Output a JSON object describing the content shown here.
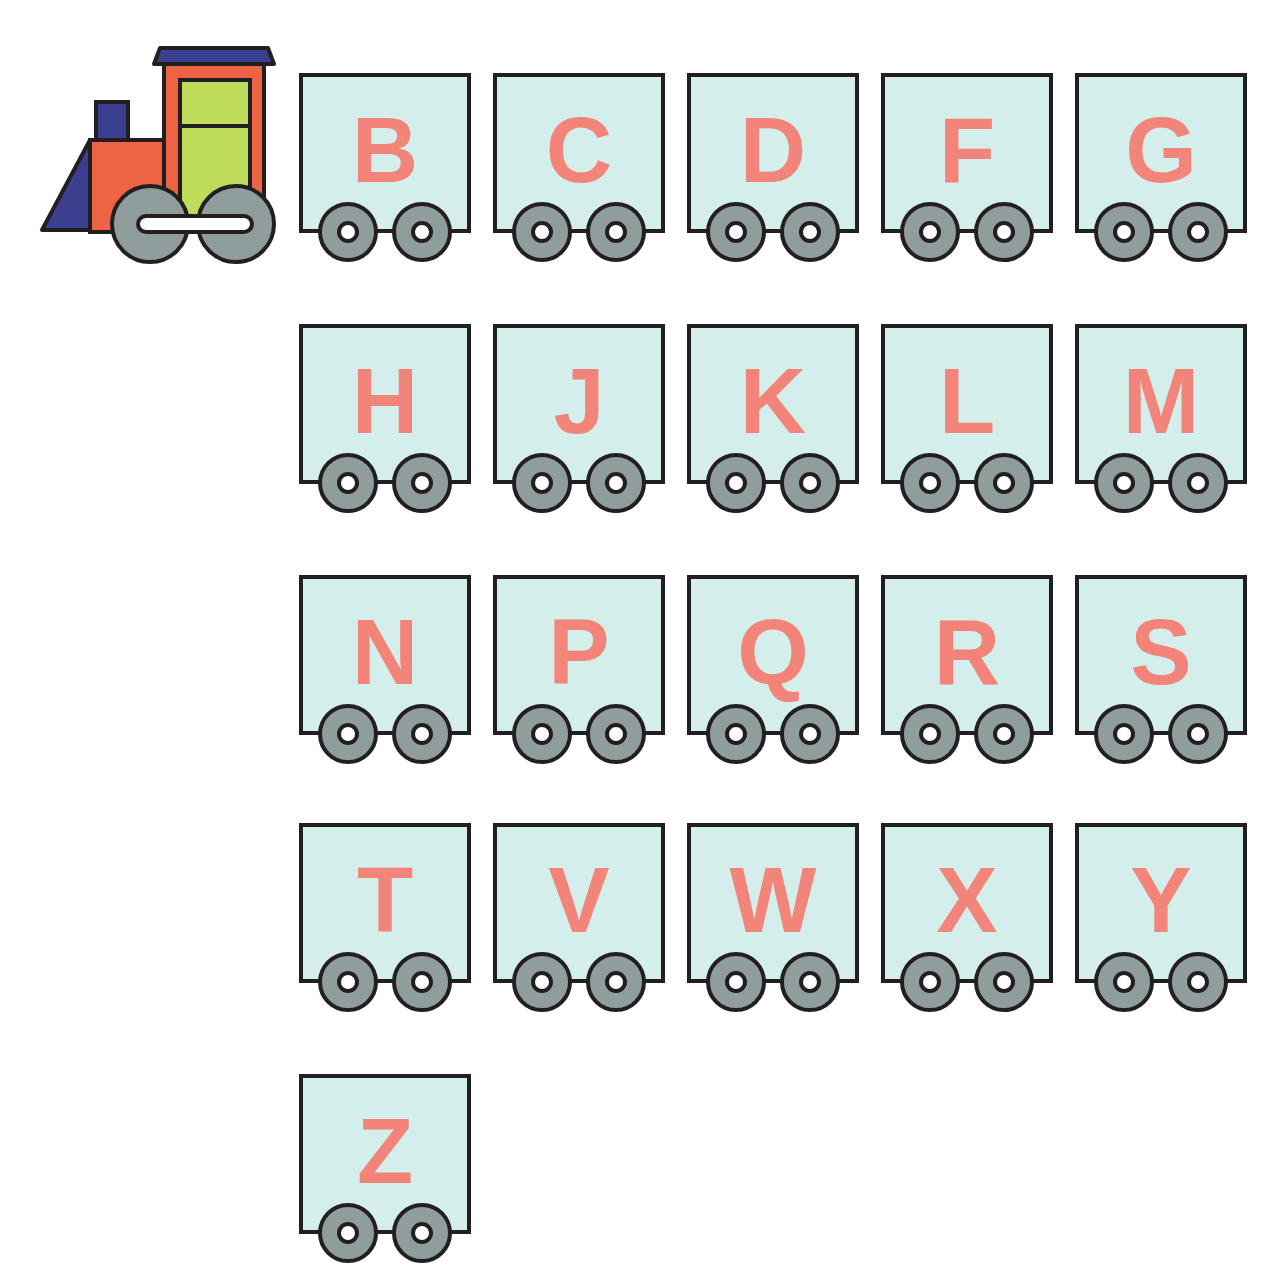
{
  "worksheet": {
    "locomotive": {
      "icon": "train-engine-icon"
    },
    "cars": [
      {
        "letter": "B"
      },
      {
        "letter": "C"
      },
      {
        "letter": "D"
      },
      {
        "letter": "F"
      },
      {
        "letter": "G"
      },
      {
        "letter": "H"
      },
      {
        "letter": "J"
      },
      {
        "letter": "K"
      },
      {
        "letter": "L"
      },
      {
        "letter": "M"
      },
      {
        "letter": "N"
      },
      {
        "letter": "P"
      },
      {
        "letter": "Q"
      },
      {
        "letter": "R"
      },
      {
        "letter": "S"
      },
      {
        "letter": "T"
      },
      {
        "letter": "V"
      },
      {
        "letter": "W"
      },
      {
        "letter": "X"
      },
      {
        "letter": "Y"
      },
      {
        "letter": "Z"
      }
    ],
    "colors": {
      "car_fill": "#d4eeeb",
      "letter": "#f28479",
      "wheel": "#8f9e9c",
      "outline": "#231f20",
      "engine_body": "#ec6443",
      "engine_cab_window": "#bedc5a",
      "engine_roof": "#3b3f8f"
    }
  }
}
